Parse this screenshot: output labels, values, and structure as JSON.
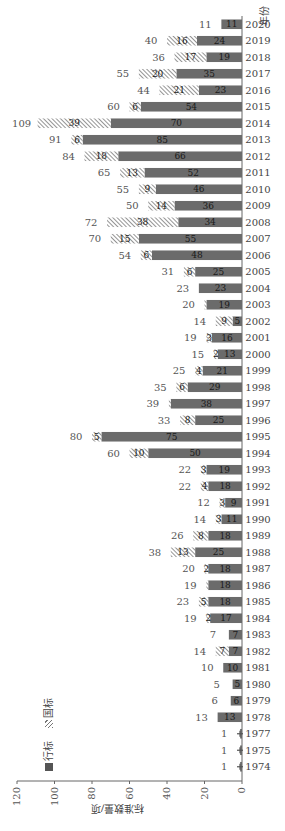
{
  "chart_data": {
    "type": "bar",
    "stacked": true,
    "orientation": "rotated 90° counter-clockwise (vertical bar chart printed sideways)",
    "title": "",
    "xlabel": "年份",
    "ylabel": "标准数量/项",
    "ylim": [
      0,
      120
    ],
    "yticks": [
      0,
      20,
      40,
      60,
      80,
      100,
      120
    ],
    "grid": false,
    "legend_position": "upper-left",
    "categories": [
      "1974",
      "1975",
      "1977",
      "1978",
      "1979",
      "1980",
      "1981",
      "1982",
      "1983",
      "1984",
      "1985",
      "1986",
      "1987",
      "1988",
      "1989",
      "1990",
      "1991",
      "1992",
      "1993",
      "1994",
      "1995",
      "1996",
      "1997",
      "1998",
      "1999",
      "2000",
      "2001",
      "2002",
      "2003",
      "2004",
      "2005",
      "2006",
      "2007",
      "2008",
      "2009",
      "2010",
      "2011",
      "2012",
      "2013",
      "2014",
      "2015",
      "2016",
      "2017",
      "2018",
      "2019",
      "2020"
    ],
    "series": [
      {
        "name": "行标",
        "color": "#6b6b6b",
        "pattern": "solid",
        "values": [
          1,
          1,
          1,
          13,
          6,
          5,
          10,
          7,
          7,
          17,
          18,
          18,
          18,
          25,
          18,
          11,
          9,
          18,
          19,
          50,
          75,
          25,
          38,
          29,
          21,
          13,
          16,
          5,
          19,
          23,
          25,
          48,
          55,
          34,
          36,
          46,
          52,
          66,
          85,
          70,
          54,
          23,
          35,
          19,
          24,
          11
        ]
      },
      {
        "name": "国标",
        "color": "#9a9a9a",
        "pattern": "hatched",
        "values": [
          0,
          0,
          0,
          0,
          0,
          0,
          0,
          7,
          0,
          2,
          5,
          1,
          2,
          13,
          8,
          3,
          3,
          4,
          3,
          10,
          5,
          8,
          1,
          6,
          4,
          2,
          3,
          9,
          1,
          0,
          6,
          6,
          15,
          38,
          14,
          9,
          13,
          18,
          6,
          39,
          6,
          21,
          20,
          17,
          16,
          0
        ]
      }
    ],
    "totals": [
      1,
      1,
      1,
      13,
      6,
      5,
      10,
      14,
      7,
      19,
      23,
      19,
      20,
      38,
      26,
      14,
      12,
      22,
      22,
      60,
      80,
      33,
      39,
      35,
      25,
      15,
      19,
      14,
      20,
      23,
      31,
      54,
      70,
      72,
      50,
      55,
      65,
      84,
      91,
      109,
      60,
      44,
      55,
      36,
      40,
      11
    ]
  },
  "legend": {
    "items": [
      {
        "label": "行标",
        "symbol": "■"
      },
      {
        "label": "国标",
        "symbol": "▨"
      }
    ]
  },
  "axis": {
    "x_title": "年份",
    "y_title": "标准数量/项"
  }
}
